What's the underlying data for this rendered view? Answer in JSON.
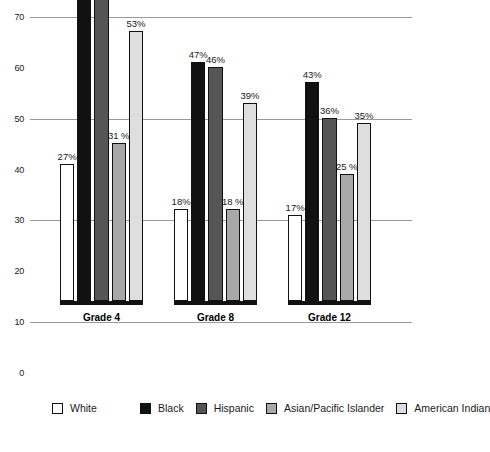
{
  "chart_data": {
    "type": "bar",
    "title": "",
    "subtitle": "",
    "xlabel": "",
    "ylabel": "",
    "categories": [
      "Grade 4",
      "Grade 8",
      "Grade 12"
    ],
    "ylim": [
      0,
      70
    ],
    "yticks": [
      0,
      10,
      20,
      30,
      40,
      50,
      60,
      70
    ],
    "ytick_labels": [
      "0",
      "10",
      "20",
      "30",
      "40",
      "50",
      "60",
      "70"
    ],
    "gridlines_at": [
      10,
      30,
      50,
      70
    ],
    "grid": true,
    "legend_position": "bottom-left",
    "series": [
      {
        "name": "White",
        "color": "#ffffff",
        "values": [
          27,
          18,
          17
        ],
        "labels": [
          "27%",
          "18%",
          "17%"
        ]
      },
      {
        "name": "Black",
        "color": "#111111",
        "values": [
          64,
          47,
          43
        ],
        "labels": [
          "64%",
          "47%",
          "43%"
        ]
      },
      {
        "name": "Hispanic",
        "color": "#555555",
        "values": [
          60,
          46,
          36
        ],
        "labels": [
          "60%",
          "46%",
          "36%"
        ]
      },
      {
        "name": "Asian/Pacific Islander",
        "color": "#a8a8a8",
        "values": [
          31,
          18,
          25
        ],
        "labels": [
          "31 %",
          "18 %",
          "25 %"
        ]
      },
      {
        "name": "American Indian",
        "color": "#dedede",
        "values": [
          53,
          39,
          35
        ],
        "labels": [
          "53%",
          "39%",
          "35%"
        ]
      }
    ]
  },
  "legend": {
    "items": [
      {
        "label": "White",
        "color": "#ffffff"
      },
      {
        "label": "Black",
        "color": "#111111"
      },
      {
        "label": "Hispanic",
        "color": "#555555"
      },
      {
        "label": "Asian/Pacific Islander",
        "color": "#a8a8a8"
      },
      {
        "label": "American Indian",
        "color": "#dedede"
      }
    ]
  }
}
